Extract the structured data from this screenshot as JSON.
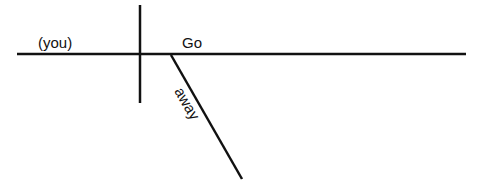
{
  "diagram": {
    "type": "sentence-diagram",
    "subject": "(you)",
    "verb": "Go",
    "modifier": "away",
    "line_color": "#111111"
  }
}
